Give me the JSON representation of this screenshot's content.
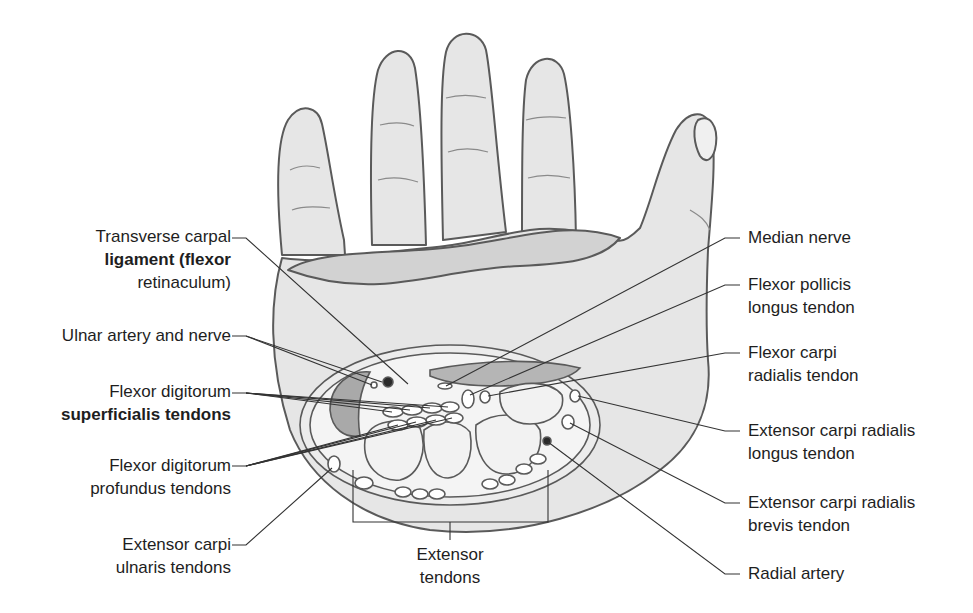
{
  "figure": {
    "type": "anatomical cross-section of wrist / carpal tunnel",
    "colors": {
      "skin_fill": "#e6e6e6",
      "skin_stroke": "#5a5a5a",
      "retinaculum_fill": "#cfcfcf",
      "muscle_fill": "#a9a9a9",
      "bone_fill": "#f2f2f2",
      "vessel_fill": "#2a2a2a",
      "leader_line": "#333333",
      "text": "#1e1e1e"
    }
  },
  "labels": {
    "left": [
      {
        "id": "transverse-carpal-ligament",
        "lines": [
          "Transverse carpal",
          "ligament (flexor",
          "retinaculum)"
        ]
      },
      {
        "id": "ulnar-artery-nerve",
        "lines": [
          "Ulnar artery and nerve"
        ]
      },
      {
        "id": "flexor-digitorum-superficialis",
        "lines": [
          "Flexor digitorum",
          "superficialis tendons"
        ]
      },
      {
        "id": "flexor-digitorum-profundus",
        "lines": [
          "Flexor digitorum",
          "profundus tendons"
        ]
      },
      {
        "id": "extensor-carpi-ulnaris",
        "lines": [
          "Extensor carpi",
          "ulnaris tendons"
        ]
      }
    ],
    "right": [
      {
        "id": "median-nerve",
        "lines": [
          "Median nerve"
        ]
      },
      {
        "id": "flexor-pollicis-longus",
        "lines": [
          "Flexor pollicis",
          "longus tendon"
        ]
      },
      {
        "id": "flexor-carpi-radialis",
        "lines": [
          "Flexor carpi",
          "radialis tendon"
        ]
      },
      {
        "id": "extensor-carpi-radialis-longus",
        "lines": [
          "Extensor carpi radialis",
          "longus tendon"
        ]
      },
      {
        "id": "extensor-carpi-radialis-brevis",
        "lines": [
          "Extensor carpi radialis",
          "brevis tendon"
        ]
      },
      {
        "id": "radial-artery",
        "lines": [
          "Radial artery"
        ]
      }
    ],
    "bottom": [
      {
        "id": "extensor-tendons",
        "lines": [
          "Extensor",
          "tendons"
        ]
      }
    ]
  }
}
